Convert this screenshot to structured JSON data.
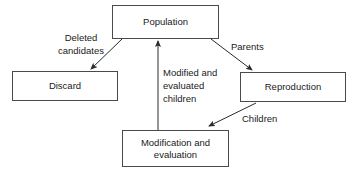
{
  "diagram": {
    "type": "flowchart",
    "background_color": "#ffffff",
    "border_color": "#4a4a4a",
    "text_color": "#1a1a1a",
    "nodes": [
      {
        "id": "population",
        "label": "Population"
      },
      {
        "id": "discard",
        "label": "Discard"
      },
      {
        "id": "reproduction",
        "label": "Reproduction"
      },
      {
        "id": "modification",
        "label": "Modification and\nevaluation"
      }
    ],
    "edges": [
      {
        "id": "population-to-discard",
        "from": "population",
        "to": "discard",
        "label": "Deleted\ncandidates",
        "arrow": "to"
      },
      {
        "id": "population-to-reproduction",
        "from": "population",
        "to": "reproduction",
        "label": "Parents",
        "arrow": "to"
      },
      {
        "id": "reproduction-to-modification",
        "from": "reproduction",
        "to": "modification",
        "label": "Children",
        "arrow": "to"
      },
      {
        "id": "modification-to-population",
        "from": "modification",
        "to": "population",
        "label": "Modified and\nevaluated\nchildren",
        "arrow": "to"
      }
    ]
  }
}
